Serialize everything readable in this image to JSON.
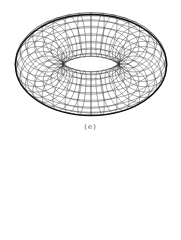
{
  "figure": {
    "caption": "(e)",
    "shape": "torus-wireframe",
    "line_color": "#2a2a2a",
    "outline_color": "#111111",
    "background": "#ffffff",
    "center": [
      91,
      64
    ],
    "major_radius": 52,
    "minor_radius": 24,
    "tilt_deg": 52,
    "meridians": 36,
    "parallels": 18
  }
}
